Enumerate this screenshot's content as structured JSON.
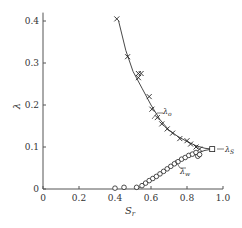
{
  "chart_data": {
    "type": "scatter",
    "title": "",
    "xlabel": "S_r",
    "ylabel": "λ",
    "xlim": [
      0,
      1.0
    ],
    "ylim": [
      0,
      0.42
    ],
    "grid": false,
    "x_ticks": [
      "0",
      "0.2",
      "0.4",
      "0.6",
      "0.8",
      "1.0"
    ],
    "y_ticks": [
      "0",
      "0.1",
      "0.2",
      "0.3",
      "0.4"
    ],
    "series": [
      {
        "name": "λ_o",
        "marker": "x",
        "line": true,
        "points": [
          [
            0.41,
            0.405
          ],
          [
            0.47,
            0.315
          ],
          [
            0.53,
            0.275
          ],
          [
            0.545,
            0.275
          ],
          [
            0.53,
            0.265
          ],
          [
            0.59,
            0.22
          ],
          [
            0.605,
            0.19
          ],
          [
            0.635,
            0.17
          ],
          [
            0.66,
            0.155
          ],
          [
            0.69,
            0.143
          ],
          [
            0.72,
            0.133
          ],
          [
            0.76,
            0.12
          ],
          [
            0.8,
            0.115
          ],
          [
            0.82,
            0.107
          ],
          [
            0.85,
            0.1
          ],
          [
            0.87,
            0.095
          ]
        ],
        "curve": [
          [
            0.42,
            0.4
          ],
          [
            0.46,
            0.33
          ],
          [
            0.5,
            0.28
          ],
          [
            0.55,
            0.24
          ],
          [
            0.6,
            0.2
          ],
          [
            0.65,
            0.165
          ],
          [
            0.7,
            0.14
          ],
          [
            0.75,
            0.125
          ],
          [
            0.8,
            0.113
          ],
          [
            0.85,
            0.103
          ],
          [
            0.9,
            0.097
          ],
          [
            0.94,
            0.095
          ]
        ]
      },
      {
        "name": "λ_w",
        "marker": "o",
        "line": true,
        "points": [
          [
            0.4,
            0.002
          ],
          [
            0.45,
            0.004
          ],
          [
            0.52,
            0.004
          ],
          [
            0.55,
            0.008
          ],
          [
            0.57,
            0.014
          ],
          [
            0.59,
            0.02
          ],
          [
            0.61,
            0.025
          ],
          [
            0.63,
            0.03
          ],
          [
            0.65,
            0.036
          ],
          [
            0.67,
            0.042
          ],
          [
            0.69,
            0.048
          ],
          [
            0.71,
            0.054
          ],
          [
            0.73,
            0.06
          ],
          [
            0.75,
            0.065
          ],
          [
            0.77,
            0.071
          ],
          [
            0.79,
            0.075
          ],
          [
            0.81,
            0.08
          ],
          [
            0.83,
            0.083
          ],
          [
            0.85,
            0.087
          ],
          [
            0.86,
            0.078
          ],
          [
            0.87,
            0.082
          ]
        ],
        "curve": [
          [
            0.52,
            0.0
          ],
          [
            0.55,
            0.008
          ],
          [
            0.6,
            0.022
          ],
          [
            0.65,
            0.036
          ],
          [
            0.7,
            0.05
          ],
          [
            0.75,
            0.064
          ],
          [
            0.8,
            0.076
          ],
          [
            0.85,
            0.085
          ],
          [
            0.9,
            0.092
          ],
          [
            0.94,
            0.095
          ]
        ]
      },
      {
        "name": "λ_s",
        "marker": "square",
        "line": false,
        "points": [
          [
            0.94,
            0.095
          ]
        ]
      }
    ],
    "annotations": [
      {
        "text": "λo",
        "x": 0.78,
        "y": 0.16,
        "points_to": "λ_o curve"
      },
      {
        "text": "λw",
        "x": 0.75,
        "y": 0.045,
        "points_to": "λ_w curve"
      },
      {
        "text": "λs",
        "x": 0.97,
        "y": 0.095,
        "points_to": "square endpoint"
      }
    ]
  },
  "labels": {
    "xlabel": "S",
    "xlabel_sub": "r",
    "ylabel": "λ",
    "ann_o": "λ",
    "ann_o_sub": "o",
    "ann_w": "λ",
    "ann_w_sub": "w",
    "ann_s": "λ",
    "ann_s_sub": "S"
  }
}
